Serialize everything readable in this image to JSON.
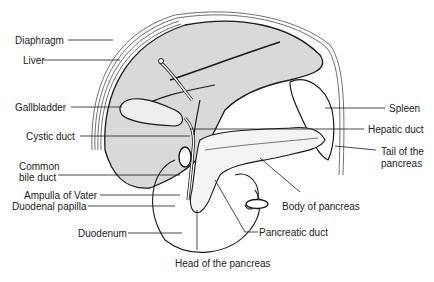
{
  "diagram": {
    "type": "anatomical-illustration",
    "colors": {
      "organ_fill": "#d9d9d9",
      "outline": "#1a1a1a",
      "background": "#ffffff",
      "text": "#222222"
    },
    "labels": {
      "diaphragm": "Diaphragm",
      "liver": "Liver",
      "gallbladder": "Gallbladder",
      "cystic_duct": "Cystic duct",
      "common_bile_duct_1": "Common",
      "common_bile_duct_2": "bile duct",
      "ampulla": "Ampulla of Vater",
      "duodenal_papilla": "Duodenal papilla",
      "duodenum": "Duodenum",
      "spleen": "Spleen",
      "hepatic_duct": "Hepatic duct",
      "tail_1": "Tail of the",
      "tail_2": "pancreas",
      "body": "Body of pancreas",
      "pancreatic_duct": "Pancreatic duct",
      "head": "Head of the pancreas"
    }
  }
}
